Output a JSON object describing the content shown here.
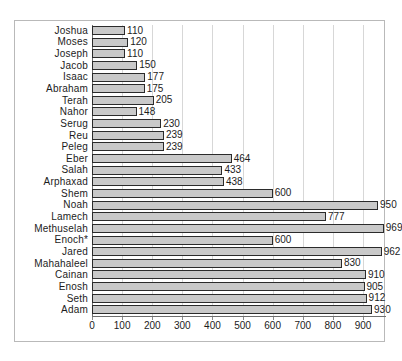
{
  "chart_data": {
    "type": "bar",
    "orientation": "horizontal",
    "title": "",
    "subtitle": "",
    "xlabel": "",
    "ylabel": "",
    "xlim": [
      0,
      900
    ],
    "xticks": [
      0,
      100,
      200,
      300,
      400,
      500,
      600,
      700,
      800,
      900
    ],
    "xtick_labels": [
      "0",
      "100",
      "200",
      "300",
      "400",
      "500",
      "600",
      "700",
      "800",
      "900"
    ],
    "grid": true,
    "grid_axis": "x",
    "legend": false,
    "legend_position": "none",
    "show_value_labels": true,
    "categories": [
      "Joshua",
      "Moses",
      "Joseph",
      "Jacob",
      "Isaac",
      "Abraham",
      "Terah",
      "Nahor",
      "Serug",
      "Reu",
      "Peleg",
      "Eber",
      "Salah",
      "Arphaxad",
      "Shem",
      "Noah",
      "Lamech",
      "Methuselah",
      "Enoch*",
      "Jared",
      "Mahahaleel",
      "Cainan",
      "Enosh",
      "Seth",
      "Adam"
    ],
    "values": [
      110,
      120,
      110,
      150,
      177,
      175,
      205,
      148,
      230,
      239,
      239,
      464,
      433,
      438,
      600,
      950,
      777,
      969,
      600,
      962,
      830,
      910,
      905,
      912,
      930
    ],
    "value_labels": [
      "110",
      "120",
      "110",
      "150",
      "177",
      "175",
      "205",
      "148",
      "230",
      "239",
      "239",
      "464",
      "433",
      "438",
      "600",
      "950",
      "777",
      "969",
      "600",
      "962",
      "830",
      "910",
      "905",
      "912",
      "930"
    ],
    "colors": {
      "bar_fill": "#c9c9c9",
      "bar_border": "#2b2b2b",
      "gridline": "#d7d7d7",
      "axis": "#6e6e6e",
      "frame": "#b9b9b9",
      "text": "#1c1c1c",
      "background": "#ffffff"
    }
  }
}
